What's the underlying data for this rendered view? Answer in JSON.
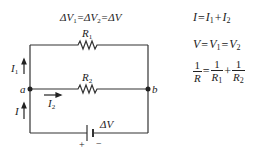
{
  "diagram": {
    "title_equation": "ΔV₁=ΔV₂=ΔV",
    "title_parts": {
      "a": "ΔV",
      "s1": "1",
      "b": "=ΔV",
      "s2": "2",
      "c": "=ΔV"
    },
    "resistors": [
      {
        "name": "R",
        "sub": "1"
      },
      {
        "name": "R",
        "sub": "2"
      }
    ],
    "currents": [
      {
        "name": "I",
        "sub": "1"
      },
      {
        "name": "I",
        "sub": "2"
      },
      {
        "name": "I",
        "sub": ""
      }
    ],
    "nodes": {
      "left": "a",
      "right": "b"
    },
    "battery": {
      "label": "ΔV",
      "plus": "+",
      "minus": "−"
    }
  },
  "equations": {
    "current": {
      "lhs": "I",
      "eq": "=",
      "t1": "I",
      "s1": "1",
      "plus": "+",
      "t2": "I",
      "s2": "2"
    },
    "voltage": {
      "lhs": "V",
      "eq1": "=",
      "t1": "V",
      "s1": "1",
      "eq2": "=",
      "t2": "V",
      "s2": "2"
    },
    "resistance": {
      "one": "1",
      "R": "R",
      "eq": "=",
      "R1": "R",
      "s1": "1",
      "plus": "+",
      "R2": "R",
      "s2": "2"
    }
  }
}
